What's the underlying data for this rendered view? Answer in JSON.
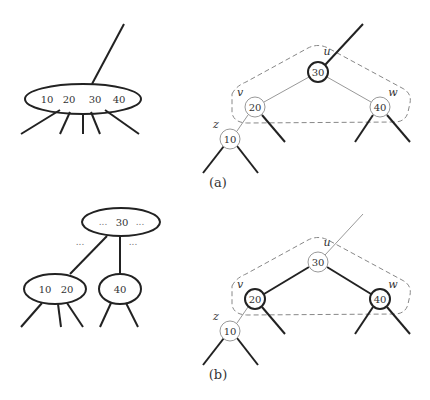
{
  "panel_a": {
    "caption": "(a)",
    "btree_node": {
      "keys": [
        "10",
        "20",
        "30",
        "40"
      ]
    },
    "rb_tree": {
      "u": {
        "label": "u",
        "key": "30"
      },
      "v": {
        "label": "v",
        "key": "20"
      },
      "w": {
        "label": "w",
        "key": "40"
      },
      "z": {
        "label": "z",
        "key": "10"
      }
    }
  },
  "panel_b": {
    "caption": "(b)",
    "btree_parent": {
      "keys": [
        "...",
        "30",
        "..."
      ]
    },
    "btree_left_dots": "...",
    "btree_right_dots": "...",
    "btree_left_child": {
      "keys": [
        "10",
        "20"
      ]
    },
    "btree_right_child": {
      "keys": [
        "40"
      ]
    },
    "rb_tree": {
      "u": {
        "label": "u",
        "key": "30"
      },
      "v": {
        "label": "v",
        "key": "20"
      },
      "w": {
        "label": "w",
        "key": "40"
      },
      "z": {
        "label": "z",
        "key": "10"
      }
    }
  },
  "colors": {
    "stroke": "#222222",
    "light": "#999999",
    "dashed": "#888888"
  }
}
